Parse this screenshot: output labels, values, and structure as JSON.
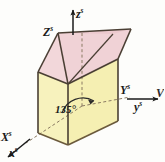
{
  "figure": {
    "kind": "3d-geometry-diagram",
    "background_color": "#fdfdfb",
    "colors": {
      "top_face": "#f2d7da",
      "left_face": "#f6f1b6",
      "right_face": "#f5efb2",
      "front_face": "#f7f2bd",
      "edge_stroke": "#4a3f34",
      "axis_stroke": "#1a1a1a",
      "dashed_stroke": "#7a6a55",
      "label_color": "#1a1a1a"
    },
    "axes": [
      {
        "id": "z-axis",
        "base": "z",
        "superscript": "s",
        "role": "vertical-axis-arrow"
      },
      {
        "id": "z-corner",
        "base": "Z",
        "superscript": "s",
        "role": "corner-label"
      },
      {
        "id": "y-corner",
        "base": "Y",
        "superscript": "s",
        "role": "corner-label"
      },
      {
        "id": "y-axis",
        "base": "y",
        "superscript": "s",
        "role": "horizontal-axis-arrow"
      },
      {
        "id": "x-corner",
        "base": "X",
        "superscript": "s",
        "role": "corner-label"
      },
      {
        "id": "x-axis",
        "base": "x",
        "superscript": "s",
        "role": "oblique-axis-arrow"
      }
    ],
    "labels": {
      "z_axis_base": "z",
      "z_axis_sup": "s",
      "z_corner_base": "Z",
      "z_corner_sup": "s",
      "y_corner_base": "Y",
      "y_corner_sup": "s",
      "y_axis_base": "y",
      "y_axis_sup": "s",
      "x_corner_base": "X",
      "x_corner_sup": "s",
      "x_axis_base": "x",
      "x_axis_sup": "s",
      "angle": "135°",
      "cropped_edge_text": "V"
    },
    "annotations": {
      "angle_value": 135,
      "angle_unit": "degrees",
      "angle_marker": "arc-with-arrowhead"
    }
  }
}
